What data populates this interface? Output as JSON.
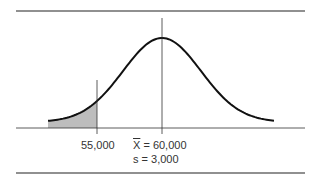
{
  "chart_data": {
    "type": "area",
    "title": "",
    "distribution": "normal",
    "mean": 60000,
    "std_dev": 3000,
    "shaded_region": {
      "from": "-inf",
      "to": 55000,
      "color": "#bdbdbd"
    },
    "reference_lines": [
      {
        "x": 55000,
        "label": "55,000"
      },
      {
        "x": 60000,
        "label": "X̄ = 60,000"
      }
    ],
    "annotations": [
      "X̄ = 60,000",
      "s = 3,000"
    ],
    "xlabel": "",
    "ylabel": "",
    "grid": false,
    "legend": null
  },
  "labels": {
    "cutoff": "55,000",
    "mean_symbol": "X",
    "mean_value": " = 60,000",
    "sd": "s = 3,000"
  },
  "colors": {
    "curve": "#111111",
    "shade": "#bdbdbd",
    "rule": "#222222"
  }
}
